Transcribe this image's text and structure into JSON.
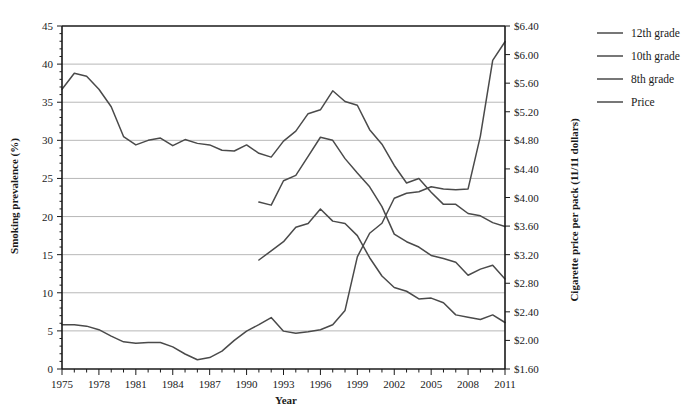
{
  "chart_data": {
    "type": "line",
    "title": "",
    "xlabel": "Year",
    "ylabel": "Smoking prevalence (%)",
    "y2label": "Cigarette price per pack (11/11 dollars)",
    "xlim": [
      1975,
      2011
    ],
    "ylim": [
      0,
      45
    ],
    "y2lim": [
      1.6,
      6.4
    ],
    "grid": true,
    "legend_position": "right",
    "x_tick_labels": [
      "1975",
      "1978",
      "1981",
      "1984",
      "1987",
      "1990",
      "1993",
      "1996",
      "1999",
      "2002",
      "2005",
      "2008",
      "2011"
    ],
    "x_tick_values": [
      1975,
      1978,
      1981,
      1984,
      1987,
      1990,
      1993,
      1996,
      1999,
      2002,
      2005,
      2008,
      2011
    ],
    "x_minor_ticks": [
      1975,
      1976,
      1977,
      1978,
      1979,
      1980,
      1981,
      1982,
      1983,
      1984,
      1985,
      1986,
      1987,
      1988,
      1989,
      1990,
      1991,
      1992,
      1993,
      1994,
      1995,
      1996,
      1997,
      1998,
      1999,
      2000,
      2001,
      2002,
      2003,
      2004,
      2005,
      2006,
      2007,
      2008,
      2009,
      2010,
      2011
    ],
    "y_tick_labels": [
      "0",
      "5",
      "10",
      "15",
      "20",
      "25",
      "30",
      "35",
      "40",
      "45"
    ],
    "y_tick_values": [
      0,
      5,
      10,
      15,
      20,
      25,
      30,
      35,
      40,
      45
    ],
    "y2_tick_labels": [
      "$1.60",
      "$2.00",
      "$2.40",
      "$2.80",
      "$3.20",
      "$3.60",
      "$4.00",
      "$4.40",
      "$4.80",
      "$5.20",
      "$5.60",
      "$6.00",
      "$6.40"
    ],
    "y2_tick_values": [
      1.6,
      2.0,
      2.4,
      2.8,
      3.2,
      3.6,
      4.0,
      4.4,
      4.8,
      5.2,
      5.6,
      6.0,
      6.4
    ],
    "line_color": "#4a4a4a",
    "series": [
      {
        "name": "12th grade",
        "axis": "left",
        "x": [
          1975,
          1976,
          1977,
          1978,
          1979,
          1980,
          1981,
          1982,
          1983,
          1984,
          1985,
          1986,
          1987,
          1988,
          1989,
          1990,
          1991,
          1992,
          1993,
          1994,
          1995,
          1996,
          1997,
          1998,
          1999,
          2000,
          2001,
          2002,
          2003,
          2004,
          2005,
          2006,
          2007,
          2008,
          2009,
          2010,
          2011
        ],
        "values": [
          36.7,
          38.8,
          38.4,
          36.7,
          34.4,
          30.5,
          29.4,
          30.0,
          30.3,
          29.3,
          30.1,
          29.6,
          29.4,
          28.7,
          28.6,
          29.4,
          28.3,
          27.8,
          29.9,
          31.2,
          33.5,
          34.0,
          36.5,
          35.1,
          34.6,
          31.4,
          29.5,
          26.7,
          24.4,
          25.0,
          23.2,
          21.6,
          21.6,
          20.4,
          20.1,
          19.2,
          18.7
        ]
      },
      {
        "name": "10th grade",
        "axis": "left",
        "x": [
          1991,
          1992,
          1993,
          1994,
          1995,
          1996,
          1997,
          1998,
          1999,
          2000,
          2001,
          2002,
          2003,
          2004,
          2005,
          2006,
          2007,
          2008,
          2009,
          2010,
          2011
        ],
        "values": [
          21.9,
          21.5,
          24.7,
          25.4,
          27.9,
          30.4,
          30.0,
          27.6,
          25.7,
          23.9,
          21.3,
          17.7,
          16.7,
          16.0,
          14.9,
          14.5,
          14.0,
          12.3,
          13.1,
          13.6,
          11.8
        ]
      },
      {
        "name": "8th grade",
        "axis": "left",
        "x": [
          1991,
          1992,
          1993,
          1994,
          1995,
          1996,
          1997,
          1998,
          1999,
          2000,
          2001,
          2002,
          2003,
          2004,
          2005,
          2006,
          2007,
          2008,
          2009,
          2010,
          2011
        ],
        "values": [
          14.3,
          15.5,
          16.7,
          18.6,
          19.1,
          21.0,
          19.4,
          19.1,
          17.5,
          14.6,
          12.2,
          10.7,
          10.2,
          9.2,
          9.3,
          8.7,
          7.1,
          6.8,
          6.5,
          7.1,
          6.1
        ]
      },
      {
        "name": "Price",
        "axis": "right",
        "x": [
          1975,
          1976,
          1977,
          1978,
          1979,
          1980,
          1981,
          1982,
          1983,
          1984,
          1985,
          1986,
          1987,
          1988,
          1989,
          1990,
          1991,
          1992,
          1993,
          1994,
          1995,
          1996,
          1997,
          1998,
          1999,
          2000,
          2001,
          2002,
          2003,
          2004,
          2005,
          2006,
          2007,
          2008,
          2009,
          2010,
          2011
        ],
        "values": [
          2.22,
          2.22,
          2.2,
          2.15,
          2.06,
          1.98,
          1.96,
          1.97,
          1.97,
          1.91,
          1.81,
          1.73,
          1.76,
          1.85,
          2.0,
          2.13,
          2.22,
          2.32,
          2.13,
          2.1,
          2.12,
          2.15,
          2.22,
          2.42,
          3.17,
          3.5,
          3.64,
          3.99,
          4.06,
          4.08,
          4.15,
          4.12,
          4.11,
          4.12,
          4.86,
          5.92,
          6.18
        ]
      }
    ]
  },
  "legend": {
    "items": [
      {
        "label": "12th grade"
      },
      {
        "label": "10th grade"
      },
      {
        "label": "8th grade"
      },
      {
        "label": "Price"
      }
    ]
  }
}
